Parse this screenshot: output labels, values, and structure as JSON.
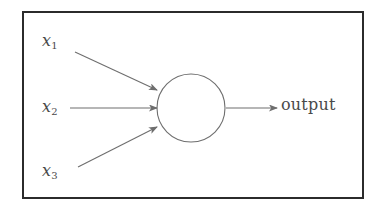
{
  "figure": {
    "name": "single-neuron-diagram",
    "frame": {
      "border_color": "#2b2b2b",
      "background_color": "#ffffff"
    },
    "ink_color": "#6e6e6e",
    "text_color": "#4a4a4a"
  },
  "inputs": [
    {
      "id": "x1",
      "base": "x",
      "sub": "1"
    },
    {
      "id": "x2",
      "base": "x",
      "sub": "2"
    },
    {
      "id": "x3",
      "base": "x",
      "sub": "3"
    }
  ],
  "node": {
    "shape": "circle",
    "label": "",
    "cx": 191,
    "cy": 108,
    "r": 34
  },
  "output": {
    "label": "output"
  },
  "edges": [
    {
      "from": "x1",
      "to": "node",
      "style": "solid-arrow"
    },
    {
      "from": "x2",
      "to": "node",
      "style": "solid-arrow"
    },
    {
      "from": "x3",
      "to": "node",
      "style": "solid-arrow"
    },
    {
      "from": "node",
      "to": "output",
      "style": "solid-arrow"
    }
  ]
}
